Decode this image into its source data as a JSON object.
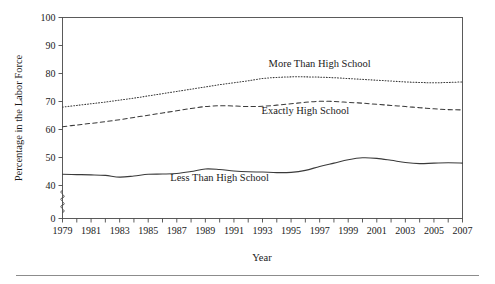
{
  "chart_data": {
    "type": "line",
    "title": "",
    "xlabel": "Year",
    "ylabel": "Percentage in the Labor Force",
    "x": [
      1979,
      1980,
      1981,
      1982,
      1983,
      1984,
      1985,
      1986,
      1987,
      1988,
      1989,
      1990,
      1991,
      1992,
      1993,
      1994,
      1995,
      1996,
      1997,
      1998,
      1999,
      2000,
      2001,
      2002,
      2003,
      2004,
      2005,
      2006,
      2007
    ],
    "xlim": [
      1979,
      2007
    ],
    "ylim": [
      40,
      100
    ],
    "y_axis_break": true,
    "y_break_from": 0,
    "y_break_to": 40,
    "xticks": [
      1979,
      1980,
      1981,
      1982,
      1983,
      1984,
      1985,
      1986,
      1987,
      1988,
      1989,
      1990,
      1991,
      1992,
      1993,
      1994,
      1995,
      1996,
      1997,
      1998,
      1999,
      2000,
      2001,
      2002,
      2003,
      2004,
      2005,
      2006,
      2007
    ],
    "xtick_labels": [
      "1979",
      "",
      "1981",
      "",
      "1983",
      "",
      "1985",
      "",
      "1987",
      "",
      "1989",
      "",
      "1991",
      "",
      "1993",
      "",
      "1995",
      "",
      "1997",
      "",
      "1999",
      "",
      "2001",
      "",
      "2003",
      "",
      "2005",
      "",
      "2007"
    ],
    "yticks": [
      0,
      40,
      50,
      60,
      70,
      80,
      90,
      100
    ],
    "ytick_labels": [
      "0",
      "40",
      "50",
      "60",
      "70",
      "80",
      "90",
      "100"
    ],
    "grid": false,
    "legend_position": "inline-annotations",
    "series": [
      {
        "name": "More Than High School",
        "style": "dotted",
        "label_x": 1997,
        "label_y": 82.5,
        "values": [
          68.0,
          68.6,
          69.2,
          69.8,
          70.5,
          71.2,
          72.0,
          72.8,
          73.6,
          74.4,
          75.2,
          76.0,
          76.7,
          77.4,
          78.2,
          78.6,
          78.8,
          78.8,
          78.7,
          78.5,
          78.2,
          77.9,
          77.6,
          77.3,
          77.0,
          76.8,
          76.7,
          76.8,
          77.0
        ]
      },
      {
        "name": "Exactly High School",
        "style": "dashed",
        "label_x": 1996,
        "label_y": 65.5,
        "values": [
          61.0,
          61.6,
          62.2,
          62.8,
          63.5,
          64.3,
          65.1,
          65.9,
          66.7,
          67.5,
          68.2,
          68.5,
          68.4,
          68.2,
          68.3,
          68.7,
          69.2,
          69.7,
          70.1,
          70.0,
          69.7,
          69.4,
          69.0,
          68.6,
          68.2,
          67.8,
          67.4,
          67.1,
          67.0
        ]
      },
      {
        "name": "Less Than High School",
        "style": "solid",
        "label_x": 1990,
        "label_y": 41.5,
        "values": [
          44.0,
          43.9,
          43.8,
          43.6,
          43.0,
          43.4,
          44.0,
          44.1,
          44.3,
          45.0,
          45.9,
          45.7,
          45.2,
          44.9,
          44.8,
          44.6,
          44.7,
          45.4,
          46.8,
          48.0,
          49.2,
          49.9,
          49.7,
          49.0,
          48.2,
          47.8,
          48.0,
          48.1,
          48.0
        ]
      }
    ]
  },
  "figure": {
    "caption_rule": true
  }
}
